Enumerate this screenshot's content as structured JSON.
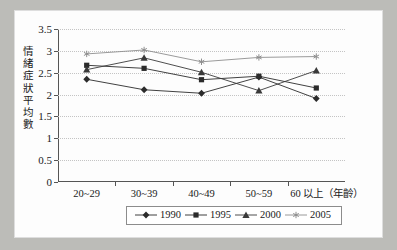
{
  "chart_data": {
    "type": "line",
    "title": "",
    "subtitle": "",
    "xlabel": "（年齡）",
    "ylabel": "情緒症狀平均數",
    "categories": [
      "20~29",
      "30~39",
      "40~49",
      "50~59",
      "60 以上"
    ],
    "x_axis_suffix": "（年齡）",
    "ylim": [
      0,
      3.5
    ],
    "ytick_labels": [
      "0",
      "0.5",
      "1",
      "1.5",
      "2",
      "2.5",
      "3",
      "3.5"
    ],
    "ytick_values": [
      0,
      0.5,
      1,
      1.5,
      2,
      2.5,
      3,
      3.5
    ],
    "grid": true,
    "grid_style": "dotted-horizontal",
    "legend_position": "bottom",
    "series": [
      {
        "name": "1990",
        "marker": "diamond",
        "color": "#2b2b2b",
        "values": [
          2.35,
          2.11,
          2.03,
          2.4,
          1.91
        ]
      },
      {
        "name": "1995",
        "marker": "square",
        "color": "#2b2b2b",
        "values": [
          2.67,
          2.6,
          2.34,
          2.42,
          2.15
        ]
      },
      {
        "name": "2000",
        "marker": "triangle",
        "color": "#3a3a3a",
        "values": [
          2.57,
          2.84,
          2.51,
          2.09,
          2.55
        ]
      },
      {
        "name": "2005",
        "marker": "asterisk",
        "color": "#8e8e8e",
        "values": [
          2.93,
          3.02,
          2.75,
          2.85,
          2.87
        ]
      }
    ]
  },
  "y_axis_title_chars": [
    "情",
    "緒",
    "症",
    "狀",
    "平",
    "均",
    "數"
  ],
  "legend": {
    "items": [
      {
        "label": "1990",
        "marker": "diamond"
      },
      {
        "label": "1995",
        "marker": "square"
      },
      {
        "label": "2000",
        "marker": "triangle"
      },
      {
        "label": "2005",
        "marker": "asterisk"
      }
    ]
  },
  "colors": {
    "page_background": "#bcbcb8",
    "paper": "#fdfdfd",
    "axis": "#555555",
    "grid": "#c4c4c4",
    "text": "#1a1a1a",
    "series_dark": "#2b2b2b",
    "series_light": "#8e8e8e"
  }
}
